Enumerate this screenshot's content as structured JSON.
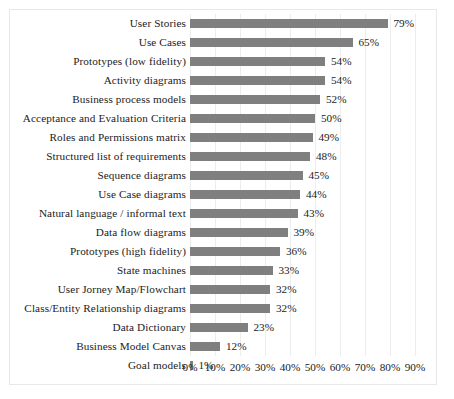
{
  "chart_data": {
    "type": "bar",
    "orientation": "horizontal",
    "title": "",
    "subtitle": "",
    "xlabel": "",
    "ylabel": "",
    "xlim": [
      0,
      90
    ],
    "xtick_labels": [
      "0%",
      "10%",
      "20%",
      "30%",
      "40%",
      "50%",
      "60%",
      "70%",
      "80%",
      "90%"
    ],
    "xtick_values": [
      0,
      10,
      20,
      30,
      40,
      50,
      60,
      70,
      80,
      90
    ],
    "grid": "vertical",
    "legend": "none",
    "bar_color": "#7f7f7f",
    "value_label_suffix": "%",
    "categories": [
      "User Stories",
      "Use Cases",
      "Prototypes (low fidelity)",
      "Activity diagrams",
      "Business process models",
      "Acceptance and Evaluation Criteria",
      "Roles and Permissions matrix",
      "Structured list of requirements",
      "Sequence diagrams",
      "Use Case diagrams",
      "Natural language / informal text",
      "Data flow diagrams",
      "Prototypes (high fidelity)",
      "State machines",
      "User Jorney Map/Flowchart",
      "Class/Entity Relationship diagrams",
      "Data Dictionary",
      "Business Model Canvas",
      "Goal models"
    ],
    "values": [
      79,
      65,
      54,
      54,
      52,
      50,
      49,
      48,
      45,
      44,
      43,
      39,
      36,
      33,
      32,
      32,
      23,
      12,
      1
    ],
    "value_labels": [
      "79%",
      "65%",
      "54%",
      "54%",
      "52%",
      "50%",
      "49%",
      "48%",
      "45%",
      "44%",
      "43%",
      "39%",
      "36%",
      "33%",
      "32%",
      "32%",
      "23%",
      "12%",
      "1%"
    ]
  }
}
